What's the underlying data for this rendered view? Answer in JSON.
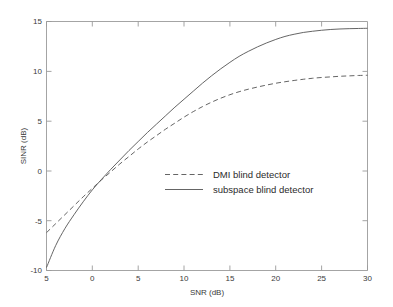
{
  "chart_data": {
    "type": "line",
    "title": "",
    "xlabel": "SNR (dB)",
    "ylabel": "SINR (dB)",
    "xlim": [
      -5,
      30
    ],
    "ylim": [
      -10,
      15
    ],
    "xticks": [
      -5,
      0,
      5,
      10,
      15,
      20,
      25,
      30
    ],
    "xtick_labels": [
      "5",
      "0",
      "5",
      "10",
      "15",
      "20",
      "25",
      "30"
    ],
    "yticks": [
      -10,
      -5,
      0,
      5,
      10,
      15
    ],
    "ytick_labels": [
      "-10",
      "-5",
      "0",
      "5",
      "10",
      "15"
    ],
    "grid": false,
    "legend_position": "center",
    "series": [
      {
        "name": "DMI blind detector",
        "style": "dashed",
        "color": "#545454",
        "x": [
          -5,
          -4,
          -3,
          -2,
          -1,
          0,
          1,
          2,
          3,
          4,
          5,
          6,
          7,
          8,
          9,
          10,
          11,
          12,
          13,
          14,
          15,
          16,
          17,
          18,
          19,
          20,
          21,
          22,
          23,
          24,
          25,
          26,
          27,
          28,
          29,
          30
        ],
        "y": [
          -6.2,
          -5.3,
          -4.4,
          -3.5,
          -2.6,
          -1.75,
          -0.9,
          -0.1,
          0.7,
          1.45,
          2.2,
          2.9,
          3.55,
          4.2,
          4.8,
          5.4,
          5.95,
          6.45,
          6.9,
          7.3,
          7.65,
          7.95,
          8.2,
          8.42,
          8.62,
          8.8,
          8.95,
          9.08,
          9.2,
          9.3,
          9.38,
          9.44,
          9.5,
          9.54,
          9.58,
          9.6
        ]
      },
      {
        "name": "subspace blind detector",
        "style": "solid",
        "color": "#545454",
        "x": [
          -5,
          -4,
          -3,
          -2,
          -1,
          0,
          1,
          2,
          3,
          4,
          5,
          6,
          7,
          8,
          9,
          10,
          11,
          12,
          13,
          14,
          15,
          16,
          17,
          18,
          19,
          20,
          21,
          22,
          23,
          24,
          25,
          26,
          27,
          28,
          29,
          30
        ],
        "y": [
          -9.7,
          -7.5,
          -5.8,
          -4.4,
          -3.1,
          -1.9,
          -0.85,
          0.15,
          1.1,
          2.05,
          2.95,
          3.85,
          4.7,
          5.55,
          6.4,
          7.2,
          8.0,
          8.8,
          9.55,
          10.25,
          10.9,
          11.5,
          12.0,
          12.45,
          12.85,
          13.2,
          13.5,
          13.72,
          13.9,
          14.02,
          14.12,
          14.2,
          14.25,
          14.28,
          14.3,
          14.32
        ]
      }
    ],
    "legend": [
      {
        "label": "DMI blind detector",
        "style": "dashed"
      },
      {
        "label": "subspace blind detector",
        "style": "solid"
      }
    ]
  },
  "colors": {
    "background": "#ffffff",
    "axis": "#9a9a9a",
    "line": "#545454",
    "text": "#3a3a3a"
  }
}
